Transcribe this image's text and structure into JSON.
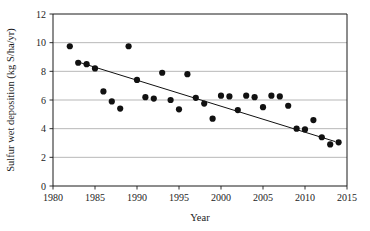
{
  "figure": {
    "background_color": "#ffffff",
    "plot_area": {
      "left_px": 53,
      "right_px": 347,
      "top_px": 14,
      "bottom_px": 186
    }
  },
  "chart_data": {
    "type": "scatter",
    "title": "",
    "xlabel": "Year",
    "ylabel": "Sulfur wet deposition (kg S/ha/yr)",
    "xlim": [
      1980,
      2015
    ],
    "ylim": [
      0,
      12
    ],
    "xticks": [
      1980,
      1985,
      1990,
      1995,
      2000,
      2005,
      2010,
      2015
    ],
    "xtick_labels": [
      "1980",
      "1985",
      "1990",
      "1995",
      "2000",
      "2005",
      "2010",
      "2015"
    ],
    "yticks": [
      0,
      2,
      4,
      6,
      8,
      10,
      12
    ],
    "ytick_labels": [
      "0",
      "2",
      "4",
      "6",
      "8",
      "10",
      "12"
    ],
    "grid": "horizontal",
    "grid_color": "#9a9a9a",
    "axis_color": "#1a1a1a",
    "marker": {
      "shape": "circle",
      "color": "#111111",
      "radius_px": 3.1
    },
    "legend": null,
    "series": [
      {
        "name": "Sulfur wet deposition",
        "x": [
          1982,
          1983,
          1984,
          1985,
          1986,
          1987,
          1988,
          1989,
          1990,
          1991,
          1992,
          1993,
          1994,
          1995,
          1996,
          1997,
          1998,
          1999,
          2000,
          2001,
          2002,
          2003,
          2004,
          2005,
          2006,
          2007,
          2008,
          2009,
          2010,
          2011,
          2012,
          2013,
          2014
        ],
        "y": [
          9.75,
          8.6,
          8.5,
          8.2,
          6.6,
          5.9,
          5.4,
          9.75,
          7.4,
          6.2,
          6.1,
          7.9,
          6.0,
          5.35,
          7.8,
          6.15,
          5.75,
          4.7,
          6.3,
          6.25,
          5.3,
          6.3,
          6.2,
          5.5,
          6.3,
          6.25,
          5.6,
          4.0,
          3.95,
          4.6,
          3.4,
          2.9,
          3.05
        ]
      }
    ],
    "trendline": {
      "type": "linear",
      "x_start": 1983.0,
      "y_start": 8.65,
      "x_end": 2013.6,
      "y_end": 3.1,
      "color": "#111111",
      "width_px": 1.0
    }
  }
}
